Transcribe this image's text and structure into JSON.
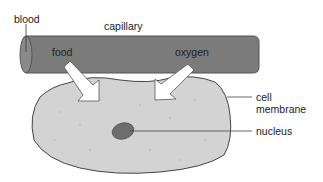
{
  "diagram": {
    "labels": {
      "blood": "blood",
      "capillary": "capillary",
      "food": "food",
      "oxygen": "oxygen",
      "cell_membrane_line1": "cell",
      "cell_membrane_line2": "membrane",
      "nucleus": "nucleus"
    },
    "colors": {
      "capillary_fill": "#7b7b7b",
      "capillary_end": "#8a8a8a",
      "cell_fill": "#d3d3d3",
      "nucleus_fill": "#6e6e6e",
      "arrow_fill": "#ffffff",
      "outline": "#444444"
    }
  }
}
